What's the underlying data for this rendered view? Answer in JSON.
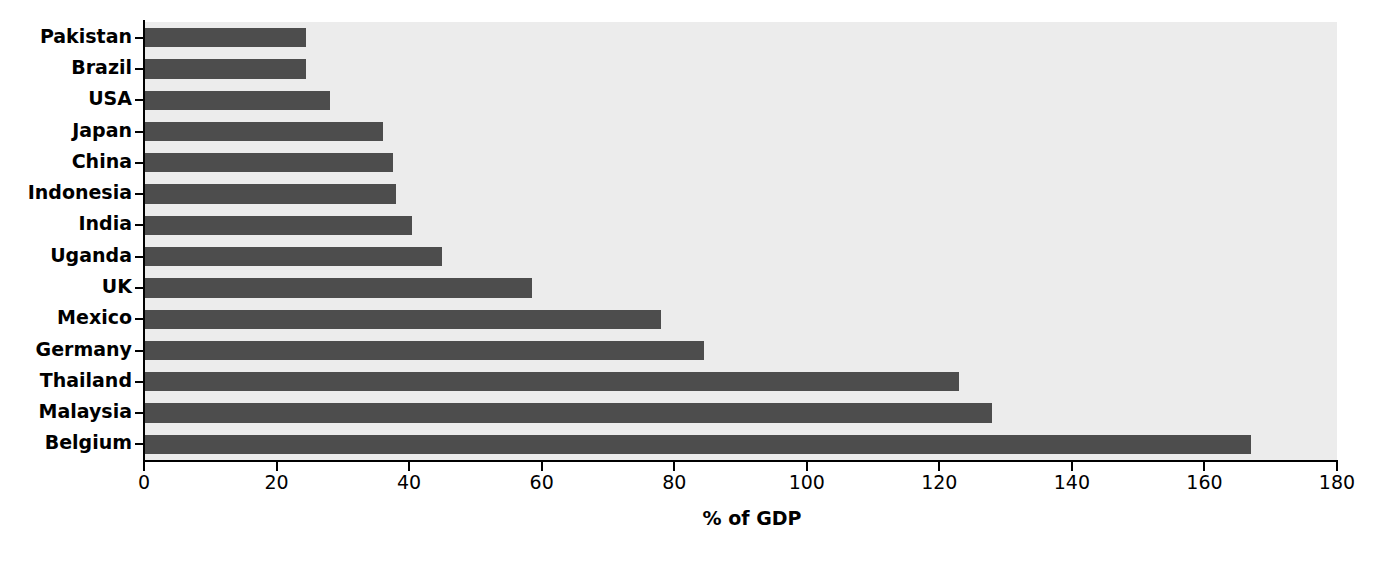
{
  "chart_data": {
    "type": "bar",
    "orientation": "horizontal",
    "title": "",
    "subtitle": "",
    "xlabel": "% of GDP",
    "ylabel": "",
    "xlim": [
      0,
      180
    ],
    "xticks": [
      0,
      20,
      40,
      60,
      80,
      100,
      120,
      140,
      160,
      180
    ],
    "xtick_labels": [
      "0",
      "20",
      "40",
      "60",
      "80",
      "100",
      "120",
      "140",
      "160",
      "180"
    ],
    "grid": false,
    "legend": null,
    "categories": [
      "Pakistan",
      "Brazil",
      "USA",
      "Japan",
      "China",
      "Indonesia",
      "India",
      "Uganda",
      "UK",
      "Mexico",
      "Germany",
      "Thailand",
      "Malaysia",
      "Belgium"
    ],
    "values": [
      24.5,
      24.5,
      28,
      36,
      37.5,
      38,
      40.5,
      45,
      58.5,
      78,
      84.5,
      123,
      128,
      167
    ],
    "series": [
      {
        "name": "% of GDP",
        "values": [
          24.5,
          24.5,
          28,
          36,
          37.5,
          38,
          40.5,
          45,
          58.5,
          78,
          84.5,
          123,
          128,
          167
        ]
      }
    ],
    "colors": {
      "bar": "#4d4d4d",
      "plot_background": "#ececec",
      "figure_background": "#ffffff",
      "axis": "#000000",
      "text": "#000000"
    }
  }
}
